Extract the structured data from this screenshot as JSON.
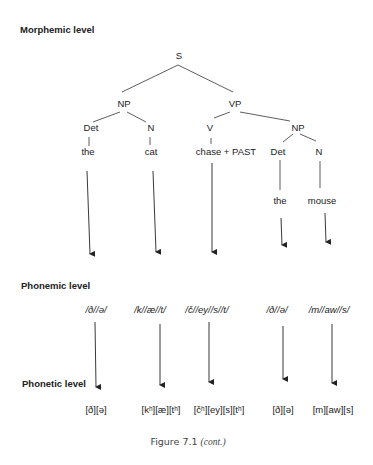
{
  "headings": {
    "morphemic": "Morphemic level",
    "phonemic": "Phonemic level",
    "phonetic": "Phonetic level"
  },
  "tree": {
    "S": "S",
    "NP1": "NP",
    "VP": "VP",
    "det1": "Det",
    "n1": "N",
    "v": "V",
    "NP2": "NP",
    "det2": "Det",
    "n2": "N",
    "words": [
      "the",
      "cat",
      "chase + PAST",
      "the",
      "mouse"
    ]
  },
  "phonemic": [
    "/ð//ə/",
    "/k//æ//t/",
    "/č//ey//s//t/",
    "/ð//ə/",
    "/m//aw//s/"
  ],
  "phonetic": [
    "[ð][ə]",
    "[kʰ][æ][tʰ]",
    "[čʰ][ey][s][tʰ]",
    "[ð][ə]",
    "[m][aw][s]"
  ],
  "caption": {
    "label": "Figure 7.1",
    "note": "(cont.)"
  }
}
